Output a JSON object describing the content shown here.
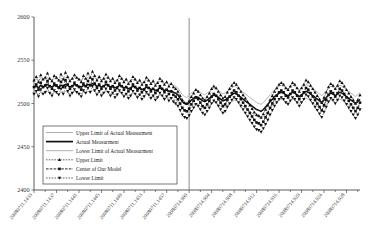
{
  "chart_data": {
    "type": "line",
    "title": "",
    "xlabel": "",
    "ylabel": "",
    "ylim": [
      2400,
      2600
    ],
    "y_ticks": [
      2400,
      2450,
      2500,
      2550,
      2600
    ],
    "grid": false,
    "legend_position": "lower-left-inside",
    "x_tick_labels": [
      "20080711.1433",
      "20080711.1437",
      "20080711.1441",
      "20080711.1445",
      "20080711.1449",
      "20080711.1453",
      "20080711.1457",
      "20080714.900",
      "20080714.904",
      "20080714.908",
      "20080714.912",
      "20080714.916",
      "20080714.920",
      "20080714.924",
      "20080714.928"
    ],
    "annotations": [
      {
        "name": "forecast-divider",
        "type": "vertical-line",
        "x_label": "20080714.900"
      }
    ],
    "series": [
      {
        "name": "Upper Limit of Actual Measurment",
        "style": "solid-thin-gray",
        "marker": "none",
        "values": [
          2527,
          2528,
          2526,
          2529,
          2527,
          2528,
          2530,
          2528,
          2527,
          2529,
          2528,
          2527,
          2529,
          2528,
          2530,
          2529,
          2527,
          2528,
          2530,
          2529,
          2528,
          2527,
          2529,
          2528,
          2530,
          2529,
          2531,
          2530,
          2528,
          2529,
          2527,
          2528,
          2530,
          2529,
          2527,
          2528,
          2526,
          2527,
          2529,
          2528,
          2526,
          2527,
          2525,
          2526,
          2528,
          2527,
          2525,
          2526,
          2524,
          2525,
          2527,
          2526,
          2524,
          2525,
          2523,
          2524,
          2526,
          2525,
          2523,
          2524,
          2522,
          2523,
          2521,
          2520,
          2518,
          2514,
          2510,
          2508,
          2507,
          2509,
          2512,
          2514,
          2516,
          2515,
          2513,
          2511,
          2510,
          2512,
          2514,
          2516,
          2518,
          2517,
          2515,
          2513,
          2511,
          2512,
          2514,
          2516,
          2518,
          2520,
          2519,
          2517,
          2515,
          2513,
          2511,
          2509,
          2507,
          2505,
          2503,
          2501,
          2500,
          2499,
          2501,
          2504,
          2507,
          2510,
          2513,
          2516,
          2518,
          2520,
          2521,
          2520,
          2518,
          2517,
          2519,
          2521,
          2520,
          2518,
          2516,
          2518,
          2520,
          2522,
          2521,
          2519,
          2517,
          2515,
          2513,
          2511,
          2509,
          2512,
          2515,
          2518,
          2520,
          2519,
          2517,
          2519,
          2521,
          2520,
          2518,
          2516,
          2514,
          2512,
          2510,
          2508,
          2510,
          2513
        ]
      },
      {
        "name": "Actual Measurment",
        "style": "solid-thick-black",
        "marker": "none",
        "values": [
          2519,
          2520,
          2518,
          2521,
          2519,
          2520,
          2522,
          2520,
          2519,
          2521,
          2520,
          2519,
          2521,
          2520,
          2522,
          2521,
          2519,
          2520,
          2522,
          2521,
          2520,
          2519,
          2521,
          2520,
          2522,
          2521,
          2523,
          2522,
          2520,
          2521,
          2519,
          2520,
          2522,
          2521,
          2519,
          2520,
          2518,
          2519,
          2521,
          2520,
          2518,
          2519,
          2517,
          2518,
          2520,
          2519,
          2517,
          2518,
          2516,
          2517,
          2519,
          2518,
          2516,
          2517,
          2515,
          2516,
          2518,
          2517,
          2515,
          2516,
          2514,
          2515,
          2513,
          2512,
          2510,
          2506,
          2502,
          2500,
          2499,
          2501,
          2504,
          2506,
          2508,
          2507,
          2505,
          2503,
          2502,
          2504,
          2506,
          2508,
          2510,
          2509,
          2507,
          2505,
          2503,
          2504,
          2506,
          2508,
          2510,
          2512,
          2511,
          2509,
          2507,
          2505,
          2503,
          2501,
          2499,
          2497,
          2495,
          2493,
          2492,
          2491,
          2493,
          2496,
          2499,
          2502,
          2505,
          2508,
          2510,
          2512,
          2513,
          2512,
          2510,
          2509,
          2511,
          2513,
          2512,
          2510,
          2508,
          2510,
          2512,
          2514,
          2513,
          2511,
          2509,
          2507,
          2505,
          2503,
          2501,
          2504,
          2507,
          2510,
          2512,
          2511,
          2509,
          2511,
          2513,
          2512,
          2510,
          2508,
          2506,
          2504,
          2502,
          2500,
          2502,
          2505
        ]
      },
      {
        "name": "Lower Limit of Actual Measurment",
        "style": "solid-thin-gray",
        "marker": "none",
        "values": [
          2511,
          2512,
          2510,
          2513,
          2511,
          2512,
          2514,
          2512,
          2511,
          2513,
          2512,
          2511,
          2513,
          2512,
          2514,
          2513,
          2511,
          2512,
          2514,
          2513,
          2512,
          2511,
          2513,
          2512,
          2514,
          2513,
          2515,
          2514,
          2512,
          2513,
          2511,
          2512,
          2514,
          2513,
          2511,
          2512,
          2510,
          2511,
          2513,
          2512,
          2510,
          2511,
          2509,
          2510,
          2512,
          2511,
          2509,
          2510,
          2508,
          2509,
          2511,
          2510,
          2508,
          2509,
          2507,
          2508,
          2510,
          2509,
          2507,
          2508,
          2506,
          2507,
          2505,
          2504,
          2502,
          2498,
          2494,
          2492,
          2491,
          2493,
          2496,
          2498,
          2500,
          2499,
          2497,
          2495,
          2494,
          2496,
          2498,
          2500,
          2502,
          2501,
          2499,
          2497,
          2495,
          2496,
          2498,
          2500,
          2502,
          2504,
          2503,
          2501,
          2499,
          2497,
          2495,
          2493,
          2491,
          2489,
          2487,
          2485,
          2484,
          2483,
          2485,
          2488,
          2491,
          2494,
          2497,
          2500,
          2502,
          2504,
          2505,
          2504,
          2502,
          2501,
          2503,
          2505,
          2504,
          2502,
          2500,
          2502,
          2504,
          2506,
          2505,
          2503,
          2501,
          2499,
          2497,
          2495,
          2493,
          2496,
          2499,
          2502,
          2504,
          2503,
          2501,
          2503,
          2505,
          2504,
          2502,
          2500,
          2498,
          2496,
          2494,
          2492,
          2494,
          2497
        ]
      },
      {
        "name": "Upper Limit",
        "style": "dashed-black",
        "marker": "triangle-up",
        "values": [
          2527,
          2531,
          2525,
          2533,
          2528,
          2530,
          2535,
          2529,
          2526,
          2532,
          2530,
          2527,
          2534,
          2528,
          2536,
          2531,
          2526,
          2529,
          2533,
          2530,
          2528,
          2525,
          2532,
          2529,
          2535,
          2530,
          2537,
          2532,
          2527,
          2531,
          2526,
          2529,
          2534,
          2530,
          2526,
          2529,
          2524,
          2527,
          2532,
          2529,
          2525,
          2528,
          2523,
          2526,
          2531,
          2528,
          2524,
          2527,
          2522,
          2525,
          2530,
          2527,
          2523,
          2526,
          2521,
          2524,
          2529,
          2526,
          2522,
          2525,
          2520,
          2523,
          2519,
          2517,
          2514,
          2509,
          2504,
          2501,
          2500,
          2503,
          2508,
          2512,
          2516,
          2514,
          2510,
          2506,
          2504,
          2508,
          2512,
          2517,
          2520,
          2518,
          2514,
          2510,
          2506,
          2508,
          2513,
          2517,
          2521,
          2524,
          2522,
          2518,
          2514,
          2510,
          2506,
          2502,
          2498,
          2494,
          2490,
          2487,
          2486,
          2484,
          2488,
          2493,
          2498,
          2504,
          2509,
          2514,
          2518,
          2522,
          2524,
          2522,
          2518,
          2516,
          2520,
          2524,
          2522,
          2518,
          2514,
          2518,
          2522,
          2527,
          2525,
          2521,
          2517,
          2513,
          2509,
          2505,
          2501,
          2507,
          2513,
          2519,
          2523,
          2521,
          2517,
          2521,
          2526,
          2524,
          2520,
          2516,
          2512,
          2508,
          2504,
          2500,
          2504,
          2510
        ]
      },
      {
        "name": "Center of Our Model",
        "style": "dash-dot-black",
        "marker": "square",
        "values": [
          2519,
          2522,
          2516,
          2524,
          2519,
          2521,
          2526,
          2520,
          2517,
          2523,
          2521,
          2518,
          2525,
          2519,
          2527,
          2522,
          2517,
          2520,
          2524,
          2521,
          2519,
          2516,
          2523,
          2520,
          2526,
          2521,
          2528,
          2523,
          2518,
          2522,
          2517,
          2520,
          2525,
          2521,
          2517,
          2520,
          2515,
          2518,
          2523,
          2520,
          2516,
          2519,
          2514,
          2517,
          2522,
          2519,
          2515,
          2518,
          2513,
          2516,
          2521,
          2518,
          2514,
          2517,
          2512,
          2515,
          2520,
          2517,
          2513,
          2516,
          2511,
          2514,
          2510,
          2508,
          2505,
          2500,
          2495,
          2492,
          2491,
          2494,
          2499,
          2503,
          2507,
          2505,
          2501,
          2497,
          2495,
          2499,
          2503,
          2508,
          2511,
          2509,
          2505,
          2501,
          2497,
          2499,
          2504,
          2508,
          2512,
          2515,
          2513,
          2509,
          2505,
          2501,
          2497,
          2493,
          2489,
          2485,
          2481,
          2478,
          2477,
          2475,
          2479,
          2484,
          2489,
          2495,
          2500,
          2505,
          2509,
          2513,
          2515,
          2513,
          2509,
          2507,
          2511,
          2515,
          2513,
          2509,
          2505,
          2509,
          2513,
          2518,
          2516,
          2512,
          2508,
          2504,
          2500,
          2496,
          2492,
          2498,
          2504,
          2510,
          2514,
          2512,
          2508,
          2512,
          2517,
          2515,
          2511,
          2507,
          2503,
          2499,
          2495,
          2491,
          2495,
          2501
        ]
      },
      {
        "name": "Lower Limit",
        "style": "dashed-black",
        "marker": "triangle-down",
        "values": [
          2511,
          2514,
          2508,
          2516,
          2511,
          2513,
          2518,
          2512,
          2509,
          2515,
          2513,
          2510,
          2517,
          2511,
          2519,
          2514,
          2509,
          2512,
          2516,
          2513,
          2511,
          2508,
          2515,
          2512,
          2518,
          2513,
          2520,
          2515,
          2510,
          2514,
          2509,
          2512,
          2517,
          2513,
          2509,
          2512,
          2507,
          2510,
          2515,
          2512,
          2508,
          2511,
          2506,
          2509,
          2514,
          2511,
          2507,
          2510,
          2505,
          2508,
          2513,
          2510,
          2506,
          2509,
          2504,
          2507,
          2512,
          2509,
          2505,
          2508,
          2503,
          2506,
          2502,
          2500,
          2497,
          2492,
          2487,
          2484,
          2483,
          2486,
          2491,
          2495,
          2499,
          2497,
          2493,
          2489,
          2487,
          2491,
          2495,
          2500,
          2503,
          2501,
          2497,
          2493,
          2489,
          2491,
          2496,
          2500,
          2504,
          2507,
          2505,
          2501,
          2497,
          2493,
          2489,
          2485,
          2481,
          2477,
          2473,
          2470,
          2469,
          2467,
          2471,
          2476,
          2481,
          2487,
          2492,
          2497,
          2501,
          2505,
          2507,
          2505,
          2501,
          2499,
          2503,
          2507,
          2505,
          2501,
          2497,
          2501,
          2505,
          2510,
          2508,
          2504,
          2500,
          2496,
          2492,
          2488,
          2484,
          2490,
          2496,
          2502,
          2506,
          2504,
          2500,
          2504,
          2509,
          2507,
          2503,
          2499,
          2495,
          2491,
          2487,
          2483,
          2487,
          2493
        ]
      }
    ]
  },
  "legend": {
    "items": [
      {
        "label": "Upper Limit of Actual Measurment",
        "style": "solid-thin-gray",
        "marker": "none"
      },
      {
        "label": "Actual Measurment",
        "style": "solid-thick-black",
        "marker": "none"
      },
      {
        "label": "Lower Limit of Actual Measurment",
        "style": "solid-thin-gray",
        "marker": "none"
      },
      {
        "label": "Upper Limit",
        "style": "dashed-black",
        "marker": "triangle-up"
      },
      {
        "label": "Center of Our Model",
        "style": "dash-dot-black",
        "marker": "square"
      },
      {
        "label": "Lower Limit",
        "style": "dashed-black",
        "marker": "triangle-down"
      }
    ]
  }
}
